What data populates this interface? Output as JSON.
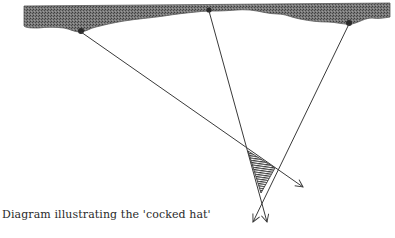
{
  "caption": "Diagram illustrating the 'cocked hat'",
  "colors": {
    "coast_fill": "#6a6a6a",
    "line": "#3a3a3a",
    "hatch": "#2e2e2e",
    "background": "#ffffff"
  },
  "coastline": {
    "label": "coastline",
    "landmarks": [
      {
        "id": "landmark-1",
        "x": 81,
        "y": 32
      },
      {
        "id": "landmark-2",
        "x": 209,
        "y": 11
      },
      {
        "id": "landmark-3",
        "x": 349,
        "y": 24
      }
    ]
  },
  "bearing_lines": [
    {
      "id": "bearing-line-1",
      "from": [
        81,
        32
      ],
      "to": [
        303,
        187
      ]
    },
    {
      "id": "bearing-line-2",
      "from": [
        209,
        11
      ],
      "to": [
        267,
        222
      ]
    },
    {
      "id": "bearing-line-3",
      "from": [
        349,
        24
      ],
      "to": [
        253,
        222
      ]
    }
  ],
  "cocked_hat": {
    "label": "cocked hat",
    "vertices": [
      [
        248,
        151
      ],
      [
        275,
        168
      ],
      [
        261,
        193
      ]
    ]
  }
}
